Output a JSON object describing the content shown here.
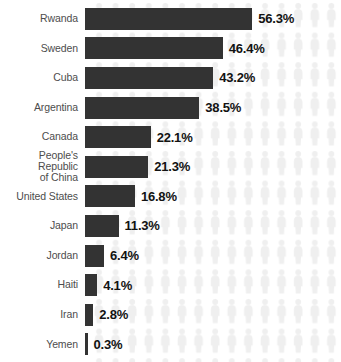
{
  "chart_data": {
    "type": "bar",
    "orientation": "horizontal",
    "title": "",
    "subtitle": "",
    "xlabel": "",
    "ylabel": "",
    "xlim": [
      0,
      60
    ],
    "grid": false,
    "legend": null,
    "value_suffix": "%",
    "categories": [
      "Rwanda",
      "Sweden",
      "Cuba",
      "Argentina",
      "Canada",
      "People's Republic\nof China",
      "United States",
      "Japan",
      "Jordan",
      "Haiti",
      "Iran",
      "Yemen"
    ],
    "values": [
      56.3,
      46.4,
      43.2,
      38.5,
      22.1,
      21.3,
      16.8,
      11.3,
      6.4,
      4.1,
      2.8,
      0.3
    ],
    "value_labels": [
      "56.3%",
      "46.4%",
      "43.2%",
      "38.5%",
      "22.1%",
      "21.3%",
      "16.8%",
      "11.3%",
      "6.4%",
      "4.1%",
      "2.8%",
      "0.3%"
    ]
  },
  "style": {
    "bar_color": "#333333",
    "label_color": "#4d4d4d",
    "value_color": "#121212",
    "background_color": "#ffffff",
    "pictogram_color": "#f0f0f0"
  },
  "rows": [
    {
      "label": "Rwanda",
      "value": "56.3%"
    },
    {
      "label": "Sweden",
      "value": "46.4%"
    },
    {
      "label": "Cuba",
      "value": "43.2%"
    },
    {
      "label": "Argentina",
      "value": "38.5%"
    },
    {
      "label": "Canada",
      "value": "22.1%"
    },
    {
      "label": "People's Republic\nof China",
      "value": "21.3%"
    },
    {
      "label": "United States",
      "value": "16.8%"
    },
    {
      "label": "Japan",
      "value": "11.3%"
    },
    {
      "label": "Jordan",
      "value": "6.4%"
    },
    {
      "label": "Haiti",
      "value": "4.1%"
    },
    {
      "label": "Iran",
      "value": "2.8%"
    },
    {
      "label": "Yemen",
      "value": "0.3%"
    }
  ]
}
